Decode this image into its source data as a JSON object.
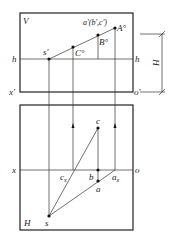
{
  "figure": {
    "type": "projection-diagram",
    "planes": {
      "vertical": {
        "label": "V"
      },
      "horizontal": {
        "label": "H"
      }
    },
    "labels": {
      "V": "V",
      "H": "H",
      "h_left": "h",
      "h_right": "h",
      "x_prime": "x'",
      "o_prime": "o'",
      "x": "x",
      "o": "o",
      "s_prime": "s'",
      "C_circ": "C°",
      "B_circ": "B°",
      "A_circ": "A°",
      "a_prime_group": "a'(b',c')",
      "c": "c",
      "b": "b",
      "a": "a",
      "cx": "c",
      "cx_sub": "x",
      "ax": "a",
      "ax_sub": "x",
      "s": "s",
      "dim_H": "H"
    },
    "points": [
      "s'",
      "C°",
      "B°",
      "A°",
      "c",
      "b",
      "a",
      "s"
    ]
  }
}
